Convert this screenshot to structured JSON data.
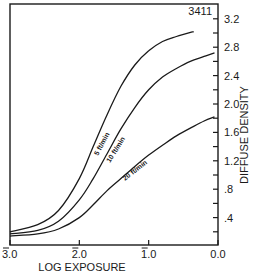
{
  "chart_data": {
    "type": "line",
    "title": "",
    "figure_id": "3411",
    "xlabel": "LOG EXPOSURE",
    "ylabel": "DIFFUSE DENSITY",
    "x_ticks": [
      "3.0",
      "2.0",
      "1.0",
      "0.0"
    ],
    "x_tick_note": "bar-notation log values (3̄.0, 2̄.0, 1̄.0)",
    "x_reversed": true,
    "xlim": [
      -3.0,
      0.0
    ],
    "y_ticks": [
      "3.2",
      "2.8",
      "2.4",
      "2.0",
      "1.6",
      "1.2",
      ".8",
      ".4"
    ],
    "ylim": [
      0,
      3.3
    ],
    "grid": false,
    "legend": "inline curve labels",
    "series": [
      {
        "name": "5 ft/min",
        "x": [
          -3.0,
          -2.6,
          -2.3,
          -2.0,
          -1.8,
          -1.6,
          -1.4,
          -1.2,
          -1.0,
          -0.8,
          -0.6,
          -0.35
        ],
        "y": [
          0.2,
          0.3,
          0.5,
          0.95,
          1.4,
          1.85,
          2.25,
          2.55,
          2.75,
          2.88,
          2.95,
          3.02
        ]
      },
      {
        "name": "10 ft/min",
        "x": [
          -3.0,
          -2.6,
          -2.3,
          -2.0,
          -1.8,
          -1.6,
          -1.4,
          -1.2,
          -1.0,
          -0.8,
          -0.6,
          -0.4,
          -0.2,
          -0.05
        ],
        "y": [
          0.17,
          0.22,
          0.35,
          0.65,
          0.95,
          1.3,
          1.65,
          1.95,
          2.2,
          2.38,
          2.5,
          2.6,
          2.67,
          2.72
        ]
      },
      {
        "name": "20 ft/min",
        "x": [
          -3.0,
          -2.6,
          -2.3,
          -2.0,
          -1.8,
          -1.6,
          -1.4,
          -1.2,
          -1.0,
          -0.8,
          -0.6,
          -0.4,
          -0.2,
          -0.05
        ],
        "y": [
          0.14,
          0.17,
          0.24,
          0.4,
          0.58,
          0.78,
          0.95,
          1.12,
          1.28,
          1.42,
          1.55,
          1.66,
          1.76,
          1.82
        ]
      }
    ]
  }
}
